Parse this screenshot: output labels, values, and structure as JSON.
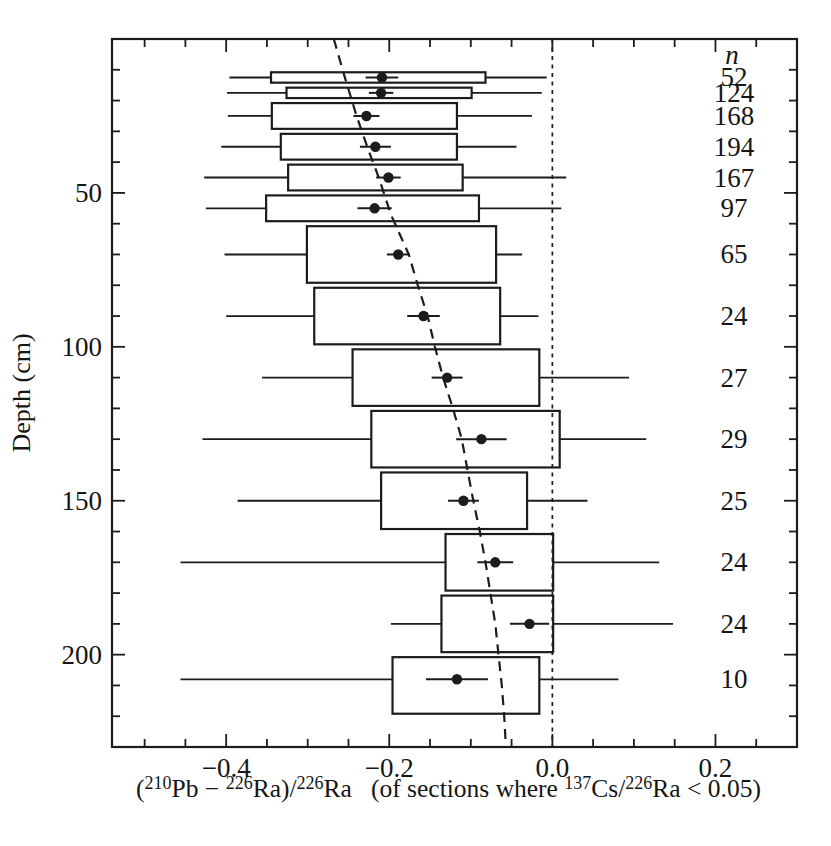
{
  "figure": {
    "background": "#ffffff",
    "ink": "#1c1c1c"
  },
  "chart_data": {
    "type": "boxplot",
    "orientation": "horizontal",
    "title": "",
    "ylabel": "Depth (cm)",
    "n_column_header": "n",
    "xlabel_segments": [
      {
        "t": "(",
        "sup": false
      },
      {
        "t": "210",
        "sup": true
      },
      {
        "t": "Pb − ",
        "sup": false
      },
      {
        "t": "226",
        "sup": true
      },
      {
        "t": "Ra)/",
        "sup": false
      },
      {
        "t": "226",
        "sup": true
      },
      {
        "t": "Ra",
        "sup": false
      },
      {
        "t": "   (of sections where ",
        "sup": false
      },
      {
        "t": "137",
        "sup": true
      },
      {
        "t": "Cs/",
        "sup": false
      },
      {
        "t": "226",
        "sup": true
      },
      {
        "t": "Ra < 0.05)",
        "sup": false
      }
    ],
    "xlim": [
      -0.54,
      0.3
    ],
    "ylim": [
      0,
      230
    ],
    "x_major_ticks": [
      {
        "v": -0.4,
        "label": "−0.4"
      },
      {
        "v": -0.2,
        "label": "−0.2"
      },
      {
        "v": 0.0,
        "label": "0.0"
      },
      {
        "v": 0.2,
        "label": "0.2"
      }
    ],
    "x_minor_step": 0.05,
    "y_major_ticks": [
      {
        "v": 50,
        "label": "50"
      },
      {
        "v": 100,
        "label": "100"
      },
      {
        "v": 150,
        "label": "150"
      },
      {
        "v": 200,
        "label": "200"
      }
    ],
    "y_minor_step": 10,
    "zero_line_x": 0.0,
    "trend_dashed": [
      [
        0,
        -0.268
      ],
      [
        12,
        -0.255
      ],
      [
        25,
        -0.24
      ],
      [
        35,
        -0.227
      ],
      [
        45,
        -0.213
      ],
      [
        57,
        -0.198
      ],
      [
        70,
        -0.176
      ],
      [
        80,
        -0.165
      ],
      [
        90,
        -0.153
      ],
      [
        100,
        -0.144
      ],
      [
        110,
        -0.134
      ],
      [
        120,
        -0.122
      ],
      [
        130,
        -0.111
      ],
      [
        140,
        -0.104
      ],
      [
        150,
        -0.097
      ],
      [
        160,
        -0.089
      ],
      [
        170,
        -0.082
      ],
      [
        180,
        -0.076
      ],
      [
        190,
        -0.07
      ],
      [
        200,
        -0.066
      ],
      [
        210,
        -0.062
      ],
      [
        220,
        -0.059
      ],
      [
        230,
        -0.057
      ]
    ],
    "rows": [
      {
        "depth_bin": [
          10,
          15
        ],
        "depth_dot": 12.5,
        "n": 52,
        "mean": -0.209,
        "se": 0.02,
        "q1": -0.345,
        "q3": -0.082,
        "whisker_lo": -0.396,
        "whisker_hi": -0.007
      },
      {
        "depth_bin": [
          15,
          20
        ],
        "depth_dot": 17.5,
        "n": 124,
        "mean": -0.21,
        "se": 0.015,
        "q1": -0.326,
        "q3": -0.099,
        "whisker_lo": -0.399,
        "whisker_hi": -0.013
      },
      {
        "depth_bin": [
          20,
          30
        ],
        "depth_dot": 25,
        "n": 168,
        "mean": -0.228,
        "se": 0.016,
        "q1": -0.344,
        "q3": -0.117,
        "whisker_lo": -0.398,
        "whisker_hi": -0.025
      },
      {
        "depth_bin": [
          30,
          40
        ],
        "depth_dot": 35,
        "n": 194,
        "mean": -0.217,
        "se": 0.019,
        "q1": -0.333,
        "q3": -0.117,
        "whisker_lo": -0.406,
        "whisker_hi": -0.044
      },
      {
        "depth_bin": [
          40,
          50
        ],
        "depth_dot": 45,
        "n": 167,
        "mean": -0.201,
        "se": 0.015,
        "q1": -0.324,
        "q3": -0.11,
        "whisker_lo": -0.427,
        "whisker_hi": 0.017
      },
      {
        "depth_bin": [
          50,
          60
        ],
        "depth_dot": 55,
        "n": 97,
        "mean": -0.218,
        "se": 0.021,
        "q1": -0.351,
        "q3": -0.09,
        "whisker_lo": -0.425,
        "whisker_hi": 0.011
      },
      {
        "depth_bin": [
          60,
          80
        ],
        "depth_dot": 70,
        "n": 65,
        "mean": -0.189,
        "se": 0.014,
        "q1": -0.301,
        "q3": -0.069,
        "whisker_lo": -0.402,
        "whisker_hi": -0.037
      },
      {
        "depth_bin": [
          80,
          100
        ],
        "depth_dot": 90,
        "n": 24,
        "mean": -0.158,
        "se": 0.02,
        "q1": -0.292,
        "q3": -0.064,
        "whisker_lo": -0.4,
        "whisker_hi": -0.017
      },
      {
        "depth_bin": [
          100,
          120
        ],
        "depth_dot": 110,
        "n": 27,
        "mean": -0.129,
        "se": 0.019,
        "q1": -0.245,
        "q3": -0.016,
        "whisker_lo": -0.356,
        "whisker_hi": 0.094
      },
      {
        "depth_bin": [
          120,
          140
        ],
        "depth_dot": 130,
        "n": 29,
        "mean": -0.087,
        "se": 0.031,
        "q1": -0.222,
        "q3": 0.009,
        "whisker_lo": -0.429,
        "whisker_hi": 0.115
      },
      {
        "depth_bin": [
          140,
          160
        ],
        "depth_dot": 150,
        "n": 25,
        "mean": -0.109,
        "se": 0.019,
        "q1": -0.21,
        "q3": -0.031,
        "whisker_lo": -0.386,
        "whisker_hi": 0.043
      },
      {
        "depth_bin": [
          160,
          180
        ],
        "depth_dot": 170,
        "n": 24,
        "mean": -0.07,
        "se": 0.022,
        "q1": -0.131,
        "q3": 0.001,
        "whisker_lo": -0.456,
        "whisker_hi": 0.131
      },
      {
        "depth_bin": [
          180,
          200
        ],
        "depth_dot": 190,
        "n": 24,
        "mean": -0.028,
        "se": 0.024,
        "q1": -0.136,
        "q3": 0.001,
        "whisker_lo": -0.198,
        "whisker_hi": 0.148
      },
      {
        "depth_bin": [
          200,
          220
        ],
        "depth_dot": 208,
        "n": 10,
        "mean": -0.117,
        "se": 0.038,
        "q1": -0.196,
        "q3": -0.016,
        "whisker_lo": -0.456,
        "whisker_hi": 0.081
      }
    ],
    "plot_frame_px": {
      "left": 112,
      "right": 797,
      "top": 39,
      "bottom": 747
    }
  }
}
